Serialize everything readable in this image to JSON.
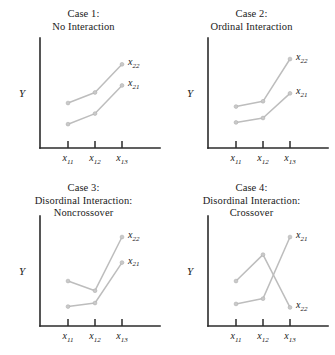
{
  "figure": {
    "width": 335,
    "height": 355,
    "background_color": "#ffffff",
    "line_color": "#bdbdbd",
    "point_color": "#c9c9c9",
    "axis_color": "#2b2b2b"
  },
  "common": {
    "y_axis_label": "Y",
    "x_tick_labels": [
      "x11",
      "x12",
      "x13"
    ],
    "x_tick_base": "x",
    "x_tick_subs": [
      "11",
      "12",
      "13"
    ],
    "series_labels": [
      "x21",
      "x22"
    ],
    "series_label_base": "x",
    "series_label_subs": [
      "21",
      "22"
    ]
  },
  "panels": [
    {
      "id": "case1",
      "title_line1": "Case 1:",
      "title_line2": "No Interaction",
      "title_line3": "",
      "series": [
        {
          "name": "x21",
          "label_base": "x",
          "label_sub": "21",
          "values": [
            0.18,
            0.3,
            0.62
          ]
        },
        {
          "name": "x22",
          "label_base": "x",
          "label_sub": "22",
          "values": [
            0.42,
            0.54,
            0.86
          ]
        }
      ]
    },
    {
      "id": "case2",
      "title_line1": "Case 2:",
      "title_line2": "Ordinal Interaction",
      "title_line3": "",
      "series": [
        {
          "name": "x21",
          "label_base": "x",
          "label_sub": "21",
          "values": [
            0.2,
            0.25,
            0.53
          ]
        },
        {
          "name": "x22",
          "label_base": "x",
          "label_sub": "22",
          "values": [
            0.38,
            0.44,
            0.92
          ]
        }
      ]
    },
    {
      "id": "case3",
      "title_line1": "Case 3:",
      "title_line2": "Disordinal Interaction:",
      "title_line3": "Noncrossover",
      "series": [
        {
          "name": "x21",
          "label_base": "x",
          "label_sub": "21",
          "values": [
            0.13,
            0.17,
            0.63
          ]
        },
        {
          "name": "x22",
          "label_base": "x",
          "label_sub": "22",
          "values": [
            0.42,
            0.31,
            0.92
          ]
        }
      ]
    },
    {
      "id": "case4",
      "title_line1": "Case 4:",
      "title_line2": "Disordinal Interaction:",
      "title_line3": "Crossover",
      "series": [
        {
          "name": "x21",
          "label_base": "x",
          "label_sub": "21",
          "values": [
            0.16,
            0.22,
            0.92
          ]
        },
        {
          "name": "x22",
          "label_base": "x",
          "label_sub": "22",
          "values": [
            0.42,
            0.72,
            0.12
          ]
        }
      ]
    }
  ],
  "chart_data": {
    "type": "line",
    "xlabel": "",
    "ylabel": "Y",
    "categories": [
      "x11",
      "x12",
      "x13"
    ],
    "ylim": [
      0,
      1
    ],
    "grid": false,
    "legend": "inline point labels at right end of each line",
    "panels": [
      {
        "title": "Case 1: No Interaction",
        "series": [
          {
            "name": "x21",
            "values": [
              0.18,
              0.3,
              0.62
            ]
          },
          {
            "name": "x22",
            "values": [
              0.42,
              0.54,
              0.86
            ]
          }
        ]
      },
      {
        "title": "Case 2: Ordinal Interaction",
        "series": [
          {
            "name": "x21",
            "values": [
              0.2,
              0.25,
              0.53
            ]
          },
          {
            "name": "x22",
            "values": [
              0.38,
              0.44,
              0.92
            ]
          }
        ]
      },
      {
        "title": "Case 3: Disordinal Interaction: Noncrossover",
        "series": [
          {
            "name": "x21",
            "values": [
              0.13,
              0.17,
              0.63
            ]
          },
          {
            "name": "x22",
            "values": [
              0.42,
              0.31,
              0.92
            ]
          }
        ]
      },
      {
        "title": "Case 4: Disordinal Interaction: Crossover",
        "series": [
          {
            "name": "x21",
            "values": [
              0.16,
              0.22,
              0.92
            ]
          },
          {
            "name": "x22",
            "values": [
              0.42,
              0.72,
              0.12
            ]
          }
        ]
      }
    ]
  }
}
